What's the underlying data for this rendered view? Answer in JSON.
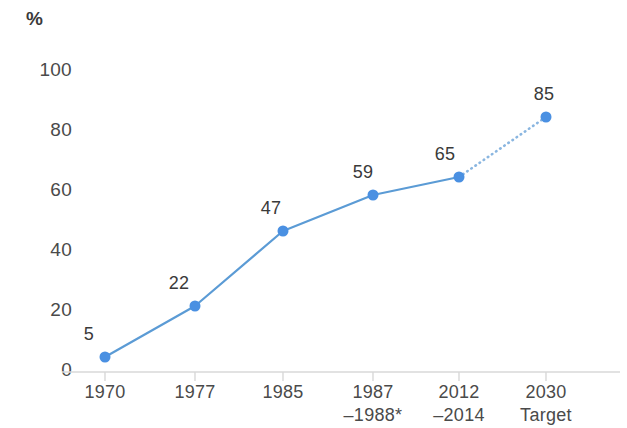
{
  "chart_data": {
    "type": "line",
    "title": "",
    "subtitle": "",
    "xlabel": "",
    "ylabel": "%",
    "ylim": [
      0,
      100
    ],
    "yticks": [
      0,
      20,
      40,
      60,
      80,
      100
    ],
    "grid": false,
    "legend": null,
    "categories": [
      "1970",
      "1977",
      "1985",
      "1987–1988*",
      "2012–2014",
      "2030 Target"
    ],
    "category_lines": [
      {
        "line1": "1970",
        "line2": ""
      },
      {
        "line1": "1977",
        "line2": ""
      },
      {
        "line1": "1985",
        "line2": ""
      },
      {
        "line1": "1987",
        "line2": "–1988*"
      },
      {
        "line1": "2012",
        "line2": "–2014"
      },
      {
        "line1": "2030",
        "line2": "Target"
      }
    ],
    "values": [
      5,
      22,
      47,
      59,
      65,
      85
    ],
    "point_labels": [
      "5",
      "22",
      "47",
      "59",
      "65",
      "85"
    ],
    "series": [
      {
        "name": "",
        "values": [
          5,
          22,
          47,
          59,
          65,
          85
        ],
        "solid_through_index": 4,
        "projected_from_index": 4,
        "projected_style": "dotted"
      }
    ],
    "annotations": [
      {
        "text": "Dotted segment indicates projection to the 2030 target",
        "visual": true
      }
    ],
    "colors": {
      "line": "#5b9bd5",
      "marker": "#4a90e2",
      "projection": "#8ab6e0",
      "text": "#3a3a3a",
      "tick_text": "#4a4a4a",
      "axis": "#d8d8d8",
      "background": "#ffffff"
    }
  },
  "geometry": {
    "baseline_y": 372,
    "top_y": 72,
    "px_per_unit": 3,
    "x_positions": [
      105,
      195,
      283,
      373,
      459,
      546
    ],
    "axis_left": 62,
    "axis_right": 620,
    "marker_radius": 5.5
  }
}
